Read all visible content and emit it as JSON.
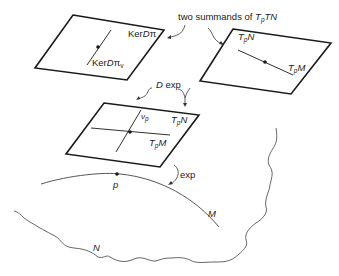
{
  "labels": {
    "header": "two summands of ",
    "header_math_T": "T",
    "header_math_p": "p",
    "header_math_TN": "TN",
    "ker_dpi": "Ker",
    "ker_dpi_D": "D",
    "ker_dpi_pi": "π",
    "ker_dpi_v": "Ker",
    "ker_dpi_v_D": "D",
    "ker_dpi_v_pi": "π",
    "ker_dpi_v_sub": "v",
    "tpn_T": "T",
    "tpn_p": "p",
    "tpn_N": "N",
    "tpm_T": "T",
    "tpm_p": "p",
    "tpm_M": "M",
    "dexp_D": "D",
    "dexp_exp": " exp",
    "mid_tpn_T": "T",
    "mid_tpn_p": "p",
    "mid_tpn_N": "N",
    "mid_tpm_T": "T",
    "mid_tpm_p": "p",
    "mid_tpm_M": "M",
    "nu_p": "ν",
    "nu_p_sub": "p",
    "exp": "exp",
    "point_p": "p",
    "manifold_M": "M",
    "manifold_N": "N"
  },
  "colors": {
    "stroke": "#1a1a1a",
    "curve": "#555555",
    "text": "#222222"
  }
}
